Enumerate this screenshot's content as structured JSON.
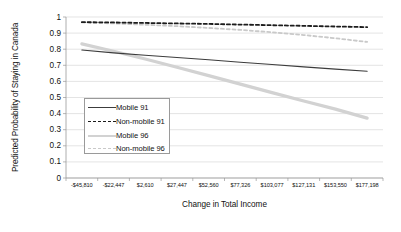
{
  "chart_data": {
    "type": "line",
    "title": "",
    "xlabel": "Change in Total Income",
    "ylabel": "Predicted Probability of Staying in Canada",
    "ylim": [
      0,
      1
    ],
    "yticks": [
      "0",
      "0.1",
      "0.2",
      "0.3",
      "0.4",
      "0.5",
      "0.6",
      "0.7",
      "0.8",
      "0.9",
      "1"
    ],
    "grid": "horizontal",
    "legend_position": "center-left inside plot",
    "categories": [
      "-$45,810",
      "-$22,447",
      "$2,610",
      "$27,447",
      "$52,560",
      "$77,326",
      "$103,077",
      "$127,131",
      "$153,550",
      "$177,198"
    ],
    "series": [
      {
        "name": "Mobile 91",
        "style": "solid",
        "color": "#3c3c3c",
        "values": [
          0.795,
          0.777,
          0.762,
          0.748,
          0.734,
          0.719,
          0.705,
          0.69,
          0.676,
          0.663
        ]
      },
      {
        "name": "Non-mobile 91",
        "style": "dashed",
        "color": "#1c1c1c",
        "values": [
          0.968,
          0.966,
          0.963,
          0.96,
          0.957,
          0.953,
          0.949,
          0.945,
          0.941,
          0.937
        ]
      },
      {
        "name": "Mobile 96",
        "style": "solid-thick",
        "color": "#d2d2d2",
        "values": [
          0.833,
          0.787,
          0.739,
          0.688,
          0.636,
          0.583,
          0.53,
          0.478,
          0.428,
          0.372
        ]
      },
      {
        "name": "Non-mobile 96",
        "style": "dashed",
        "color": "#c9c9c9",
        "values": [
          0.966,
          0.96,
          0.952,
          0.943,
          0.932,
          0.92,
          0.905,
          0.888,
          0.868,
          0.845
        ]
      }
    ]
  },
  "axis": {
    "y_title": "Predicted Probability of Staying in Canada",
    "x_title": "Change in Total Income"
  },
  "legend": {
    "entries": [
      {
        "label": "Mobile 91"
      },
      {
        "label": "Non-mobile 91"
      },
      {
        "label": "Mobile 96"
      },
      {
        "label": "Non-mobile 96"
      }
    ]
  }
}
